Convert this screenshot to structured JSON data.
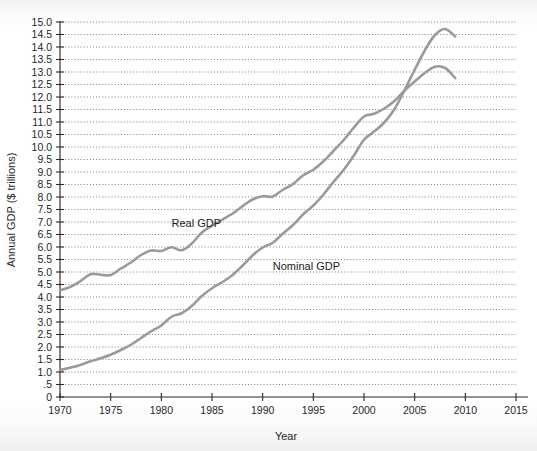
{
  "chart_data": {
    "type": "line",
    "title": "",
    "xlabel": "Year",
    "ylabel": "Annual GDP ($ trillions)",
    "xlim": [
      1970,
      2015
    ],
    "ylim": [
      0,
      15
    ],
    "grid": true,
    "legend_position": "inline-annotations",
    "xticks": [
      1970,
      1975,
      1980,
      1985,
      1990,
      1995,
      2000,
      2005,
      2010,
      2015
    ],
    "xtick_labels": [
      "1970",
      "1975",
      "1980",
      "1985",
      "1990",
      "1995",
      "2000",
      "2005",
      "2010",
      "2015"
    ],
    "yticks": [
      0,
      0.5,
      1.0,
      1.5,
      2.0,
      2.5,
      3.0,
      3.5,
      4.0,
      4.5,
      5.0,
      5.5,
      6.0,
      6.5,
      7.0,
      7.5,
      8.0,
      8.5,
      9.0,
      9.5,
      10.0,
      10.5,
      11.0,
      11.5,
      12.0,
      12.5,
      13.0,
      13.5,
      14.0,
      14.5,
      15.0
    ],
    "ytick_labels": [
      "0",
      ".5",
      "1.0",
      "1.5",
      "2.0",
      "2.5",
      "3.0",
      "3.5",
      "4.0",
      "4.5",
      "5.0",
      "5.5",
      "6.0",
      "6.5",
      "7.0",
      "7.5",
      "8.0",
      "8.5",
      "9.0",
      "9.5",
      "10.0",
      "10.5",
      "11.0",
      "11.5",
      "12.0",
      "12.5",
      "13.0",
      "13.5",
      "14.0",
      "14.5",
      "15.0"
    ],
    "annotations": [
      {
        "text": "Real GDP",
        "x": 1981.0,
        "y": 6.8
      },
      {
        "text": "Nominal GDP",
        "x": 1991.0,
        "y": 5.1
      }
    ],
    "x": [
      1970,
      1971,
      1972,
      1973,
      1974,
      1975,
      1976,
      1977,
      1978,
      1979,
      1980,
      1981,
      1982,
      1983,
      1984,
      1985,
      1986,
      1987,
      1988,
      1989,
      1990,
      1991,
      1992,
      1993,
      1994,
      1995,
      1996,
      1997,
      1998,
      1999,
      2000,
      2001,
      2002,
      2003,
      2004,
      2005,
      2006,
      2007,
      2008,
      2009
    ],
    "series": [
      {
        "name": "Real GDP",
        "color": "#9a9a9a",
        "values": [
          4.27,
          4.4,
          4.63,
          4.91,
          4.89,
          4.88,
          5.14,
          5.38,
          5.68,
          5.86,
          5.84,
          5.99,
          5.87,
          6.14,
          6.58,
          6.85,
          7.09,
          7.33,
          7.63,
          7.9,
          8.03,
          8.02,
          8.29,
          8.52,
          8.87,
          9.09,
          9.43,
          9.85,
          10.28,
          10.78,
          11.22,
          11.33,
          11.54,
          11.84,
          12.26,
          12.62,
          12.96,
          13.21,
          13.16,
          12.76
        ],
        "label_visible": true
      },
      {
        "name": "Nominal GDP",
        "color": "#9a9a9a",
        "values": [
          1.08,
          1.17,
          1.28,
          1.43,
          1.55,
          1.69,
          1.88,
          2.09,
          2.36,
          2.63,
          2.86,
          3.21,
          3.35,
          3.64,
          4.04,
          4.35,
          4.59,
          4.87,
          5.25,
          5.66,
          5.98,
          6.17,
          6.54,
          6.88,
          7.31,
          7.66,
          8.1,
          8.61,
          9.09,
          9.66,
          10.29,
          10.62,
          10.98,
          11.51,
          12.27,
          13.09,
          13.86,
          14.48,
          14.72,
          14.42
        ],
        "label_visible": true
      }
    ]
  }
}
